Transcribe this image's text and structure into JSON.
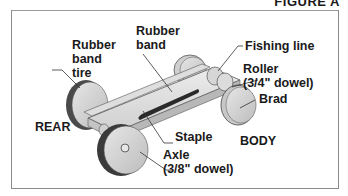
{
  "figure": {
    "title": "FIGURE A"
  },
  "labels": {
    "rubber_band_tire": [
      "Rubber",
      "band",
      "tire"
    ],
    "rubber_band": [
      "Rubber",
      "band"
    ],
    "fishing_line": "Fishing line",
    "roller": [
      "Roller",
      "(3/4\" dowel)"
    ],
    "brad": "Brad",
    "rear": "REAR",
    "staple": "Staple",
    "body": "BODY",
    "axle": [
      "Axle",
      "(3/8\" dowel)"
    ]
  }
}
